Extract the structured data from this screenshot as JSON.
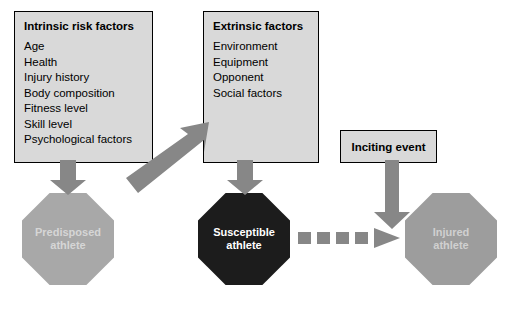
{
  "diagram": {
    "colors": {
      "box_fill": "#d9d9d9",
      "box_border": "#000000",
      "arrow_gray": "#878787",
      "octagon_light": "#a8a8a8",
      "octagon_dark": "#1c1c1c",
      "octagon_right": "#9d9d9d",
      "label_light_text": "#d6d6d6",
      "label_dark_text": "#ffffff"
    },
    "boxes": [
      {
        "id": "intrinsic",
        "title": "Intrinsic risk factors",
        "items": [
          "Age",
          "Health",
          "Injury history",
          "Body composition",
          "Fitness level",
          "Skill level",
          "Psychological factors"
        ]
      },
      {
        "id": "extrinsic",
        "title": "Extrinsic factors",
        "items": [
          "Environment",
          "Equipment",
          "Opponent",
          "Social factors"
        ]
      },
      {
        "id": "inciting",
        "title": "Inciting event",
        "items": []
      }
    ],
    "nodes": [
      {
        "id": "predisposed",
        "line1": "Predisposed",
        "line2": "athlete"
      },
      {
        "id": "susceptible",
        "line1": "Susceptible",
        "line2": "athlete"
      },
      {
        "id": "injured",
        "line1": "Injured",
        "line2": "athlete"
      }
    ],
    "arrows": [
      {
        "id": "intrinsic-to-predisposed",
        "style": "solid-down",
        "icon": "arrow-down-icon"
      },
      {
        "id": "extrinsic-to-susceptible",
        "style": "solid-down",
        "icon": "arrow-down-icon"
      },
      {
        "id": "inciting-to-flow",
        "style": "solid-down",
        "icon": "arrow-down-icon"
      },
      {
        "id": "predisposed-to-extrinsic",
        "style": "solid-diagonal",
        "icon": "arrow-up-right-icon"
      },
      {
        "id": "susceptible-to-injured",
        "style": "dotted-right",
        "icon": "arrow-right-dotted-icon"
      }
    ]
  }
}
